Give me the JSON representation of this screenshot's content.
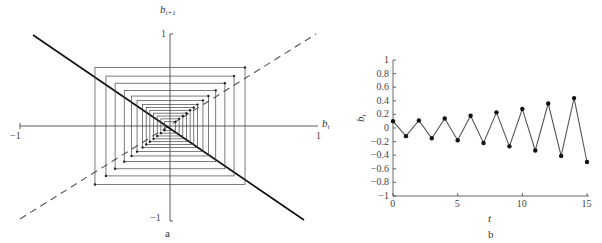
{
  "panel_a": {
    "caption": "a",
    "x_label_base": "b",
    "x_label_sub": "t",
    "y_label_base": "b",
    "y_label_sub": "t+1",
    "x_tick_min": "−1",
    "x_tick_max": "1",
    "y_tick_min": "−1",
    "y_tick_max": "1"
  },
  "panel_b": {
    "caption": "b",
    "x_label": "t",
    "y_label_base": "b",
    "y_label_sub": "t",
    "x_ticks": [
      "0",
      "5",
      "10",
      "15"
    ],
    "y_ticks": [
      "1",
      "0.8",
      "0.6",
      "0.4",
      "0.2",
      "0",
      "−0.2",
      "−0.4",
      "−0.6",
      "−0.8",
      "−1"
    ]
  },
  "chart_data": [
    {
      "type": "line",
      "title": "Cobweb diagram",
      "panel": "a",
      "xlabel": "b_t",
      "ylabel": "b_{t+1}",
      "xlim": [
        -1,
        1
      ],
      "ylim": [
        -1,
        1
      ],
      "series": [
        {
          "name": "b_{t+1} = -b_t (solid, slightly steeper)",
          "style": "solid",
          "x": [
            -1,
            1
          ],
          "y": [
            0.98,
            -1.05
          ]
        },
        {
          "name": "45-degree line b_{t+1} = b_t",
          "style": "dashed",
          "x": [
            -1,
            1
          ],
          "y": [
            -1,
            1
          ]
        },
        {
          "name": "cobweb spiral (diverging)",
          "style": "thin",
          "amplitudes": [
            0.03,
            0.05,
            0.07,
            0.09,
            0.11,
            0.13,
            0.15,
            0.18,
            0.21,
            0.25,
            0.3,
            0.35,
            0.41
          ]
        }
      ],
      "grid": false
    },
    {
      "type": "line",
      "title": "",
      "panel": "b",
      "xlabel": "t",
      "ylabel": "b_t",
      "xlim": [
        0,
        15
      ],
      "ylim": [
        -1,
        1
      ],
      "x": [
        0,
        1,
        2,
        3,
        4,
        5,
        6,
        7,
        8,
        9,
        10,
        11,
        12,
        13,
        14,
        15
      ],
      "series": [
        {
          "name": "b_t",
          "values": [
            0.1,
            -0.12,
            0.11,
            -0.15,
            0.14,
            -0.18,
            0.18,
            -0.22,
            0.23,
            -0.27,
            0.28,
            -0.33,
            0.36,
            -0.41,
            0.44,
            -0.5
          ]
        }
      ],
      "grid": false,
      "markers": true
    }
  ]
}
